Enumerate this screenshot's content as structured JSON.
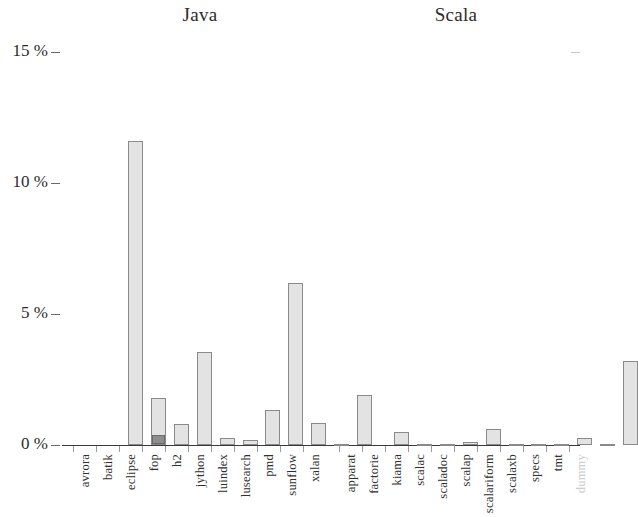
{
  "chart_data": {
    "type": "bar",
    "title": "",
    "subtitle": "",
    "xlabel": "",
    "ylabel": "",
    "ylim": [
      0,
      15
    ],
    "y_unit": "%",
    "grid": false,
    "legend": "none",
    "y_ticks": [
      "0 %",
      "5 %",
      "10 %",
      "15 %"
    ],
    "y_tick_values": [
      0,
      5,
      10,
      15
    ],
    "group_headings": [
      "Java",
      "Scala"
    ],
    "categories": [
      "avrora",
      "batik",
      "eclipse",
      "fop",
      "h2",
      "jython",
      "luindex",
      "lusearch",
      "pmd",
      "sunflow",
      "xalan",
      "apparat",
      "factorie",
      "kiama",
      "scalac",
      "scaladoc",
      "scalap",
      "scalariform",
      "scalaxb",
      "specs",
      "tmt",
      "dummy"
    ],
    "values": [
      11.6,
      1.8,
      0.8,
      3.55,
      0.25,
      0.2,
      1.35,
      6.2,
      0.85,
      0.02,
      1.9,
      0.5,
      0.02,
      0.02,
      0.12,
      0.6,
      0.05,
      0.02,
      0.02,
      0.28,
      0.02,
      3.2
    ],
    "sub_values": [
      0,
      0.35,
      0,
      0,
      0,
      0,
      0,
      0,
      0,
      0,
      0,
      0,
      0,
      0,
      0,
      0,
      0,
      0,
      0,
      0,
      0,
      0
    ],
    "muted_categories": [
      "dummy"
    ],
    "group_spans": [
      {
        "name": "Java",
        "start": 0,
        "end": 10
      },
      {
        "name": "Scala",
        "start": 11,
        "end": 21
      }
    ],
    "series": [
      {
        "name": "total",
        "values": [
          11.6,
          1.8,
          0.8,
          3.55,
          0.25,
          0.2,
          1.35,
          6.2,
          0.85,
          0.02,
          1.9,
          0.5,
          0.02,
          0.02,
          0.12,
          0.6,
          0.05,
          0.02,
          0.02,
          0.28,
          0.02,
          3.2
        ],
        "color": "#e3e3e3"
      },
      {
        "name": "dark-segment",
        "values": [
          0,
          0.35,
          0,
          0,
          0,
          0,
          0,
          0,
          0,
          0,
          0,
          0,
          0,
          0,
          0,
          0,
          0,
          0,
          0,
          0,
          0,
          0
        ],
        "color": "#8e8e8e"
      }
    ],
    "colors": {
      "bar_fill": "#e3e3e3",
      "bar_edge": "#8a8a8a",
      "bar_sub_fill": "#8e8e8e",
      "axis": "#3a3a3a",
      "text": "#2b2b2b",
      "muted_text": "#cccccc"
    }
  }
}
